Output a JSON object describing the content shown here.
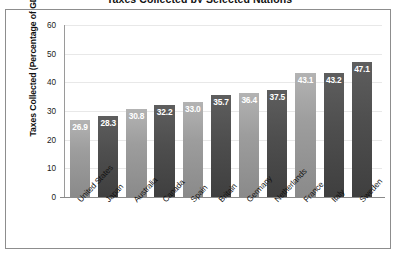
{
  "chart_data": {
    "type": "bar",
    "title": "Taxes Collected by Selected Nations",
    "xlabel": "",
    "ylabel": "Taxes Collected (Percentage of GDP)",
    "ylim": [
      0,
      60
    ],
    "ytick_labels": [
      "60",
      "50",
      "40",
      "30",
      "20",
      "10",
      "0"
    ],
    "yticks": [
      60,
      50,
      40,
      30,
      20,
      10,
      0
    ],
    "grid": true,
    "legend": "none",
    "categories": [
      "United States",
      "Japan",
      "Australia",
      "Canada",
      "Spain",
      "Britain",
      "Germany",
      "Netherlands",
      "France",
      "Italy",
      "Sweden"
    ],
    "values": [
      26.9,
      28.3,
      30.8,
      32.2,
      33.0,
      35.7,
      36.4,
      37.5,
      43.1,
      43.2,
      47.1
    ],
    "value_labels": [
      "26.9",
      "28.3",
      "30.8",
      "32.2",
      "33.0",
      "35.7",
      "36.4",
      "37.5",
      "43.1",
      "43.2",
      "47.1"
    ],
    "bar_shades": [
      "light",
      "dark",
      "light",
      "dark",
      "light",
      "dark",
      "light",
      "dark",
      "light",
      "dark",
      "dark"
    ],
    "colors": {
      "bar_light": "#9d9d9d",
      "bar_dark": "#4e4e4e",
      "value_label": "#ffffff",
      "gridline": "#e8e8e8",
      "axis": "#8a8a8a",
      "frame": "#8d8d8d",
      "background": "#ffffff",
      "text": "#111111"
    }
  }
}
